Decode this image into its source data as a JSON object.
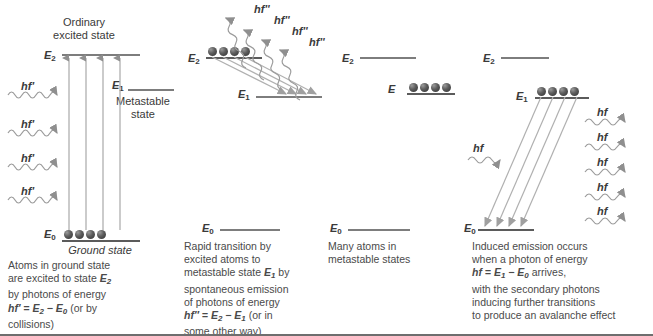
{
  "figure": {
    "type": "physics-energy-level-diagram",
    "accent_line_color": "#7d7d7d",
    "atom_color": "#2e2e2e",
    "text_color": "#4a4a4a"
  },
  "panels": [
    {
      "id": "panel-1",
      "heading_line1": "Ordinary",
      "heading_line2": "excited state",
      "levels": [
        {
          "name": "E",
          "sub": "2",
          "kind": "excited"
        },
        {
          "name": "E",
          "sub": "1",
          "kind": "metastable"
        },
        {
          "name": "E",
          "sub": "0",
          "kind": "ground"
        }
      ],
      "metastable_label_line1": "Metastable",
      "metastable_label_line2": "state",
      "ground_state_label": "Ground state",
      "photons_in": [
        "hf'",
        "hf'",
        "hf'",
        "hf'"
      ],
      "atom_count": 4,
      "caption_lines": [
        "Atoms in ground state",
        "are excited to state E2",
        "by photons of energy",
        "hf' = E2 − E0 (or by",
        "collisions)"
      ]
    },
    {
      "id": "panel-2",
      "levels": [
        {
          "name": "E",
          "sub": "2",
          "kind": "excited"
        },
        {
          "name": "E",
          "sub": "1",
          "kind": "metastable"
        },
        {
          "name": "E",
          "sub": "0",
          "kind": "ground"
        }
      ],
      "photons_out": [
        "hf''",
        "hf''",
        "hf''",
        "hf''"
      ],
      "atom_count": 4,
      "caption_lines": [
        "Rapid transition by",
        "excited atoms to",
        "metastable state E1 by",
        "spontaneous emission",
        "of photons of energy",
        "hf'' = E2 − E1 (or in",
        "some other way)"
      ]
    },
    {
      "id": "panel-3",
      "levels": [
        {
          "name": "E",
          "sub": "2",
          "kind": "excited"
        },
        {
          "name": "E",
          "sub": "",
          "kind": "metastable-populated"
        },
        {
          "name": "E",
          "sub": "0",
          "kind": "ground"
        }
      ],
      "atom_count": 4,
      "caption_lines": [
        "Many atoms in",
        "metastable states"
      ]
    },
    {
      "id": "panel-4",
      "levels": [
        {
          "name": "E",
          "sub": "2",
          "kind": "excited"
        },
        {
          "name": "E",
          "sub": "1",
          "kind": "metastable"
        },
        {
          "name": "E",
          "sub": "0",
          "kind": "ground"
        }
      ],
      "incoming_photon": "hf",
      "photons_out": [
        "hf",
        "hf",
        "hf",
        "hf",
        "hf"
      ],
      "atom_count": 4,
      "caption_lines": [
        "Induced emission occurs",
        "when a photon of energy",
        "hf = E1 − E0 arrives,",
        "with the secondary photons",
        "inducing further transitions",
        "to produce an avalanche effect"
      ]
    }
  ]
}
